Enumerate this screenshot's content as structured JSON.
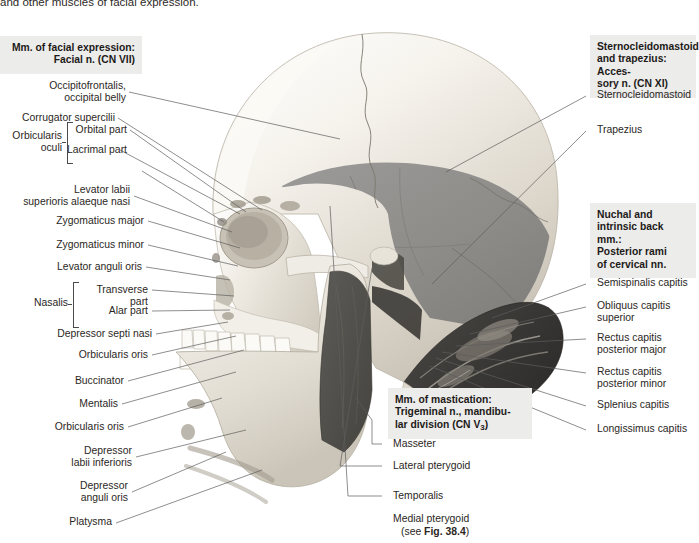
{
  "figure": {
    "top_caption": "and other muscles of facial expression."
  },
  "headers": {
    "facial": "Mm. of facial expression:\nFacial n. (CN VII)",
    "facial_line1": "Mm. of facial expression:",
    "facial_line2": "Facial n. (CN VII)",
    "scm": "Sternocleidomastoid and trapezius: Accessory n. (CN XI)",
    "scm_line1": "Sternocleidomastoid",
    "scm_line2": "and trapezius: Acces-",
    "scm_line3": "sory n. (CN XI)",
    "nuchal_line1": "Nuchal and",
    "nuchal_line2": "intrinsic back mm.:",
    "nuchal_line3": "Posterior rami",
    "nuchal_line4": "of cervical nn.",
    "mastication_line1": "Mm. of mastication:",
    "mastication_line2": "Trigeminal n., mandibu-",
    "mastication_line3a": "lar division (CN V",
    "mastication_line3sub": "3",
    "mastication_line3b": ")"
  },
  "left_labels": [
    {
      "id": "occipitofrontalis",
      "text": "Occipitofrontalis,\noccipital belly"
    },
    {
      "id": "corrugator-supercilii",
      "text": "Corrugator supercilii"
    },
    {
      "id": "orbital-part",
      "text": "Orbital part"
    },
    {
      "id": "lacrimal-part",
      "text": "Lacrimal part"
    },
    {
      "id": "orbicularis-oculi",
      "text": "Orbicularis\noculi"
    },
    {
      "id": "levator-labii-superioris-alaeque-nasi",
      "text": "Levator labii\nsuperioris alaeque nasi"
    },
    {
      "id": "zygomaticus-major",
      "text": "Zygomaticus major"
    },
    {
      "id": "zygomaticus-minor",
      "text": "Zygomaticus minor"
    },
    {
      "id": "levator-anguli-oris",
      "text": "Levator anguli oris"
    },
    {
      "id": "nasalis",
      "text": "Nasalis"
    },
    {
      "id": "transverse-part",
      "text": "Transverse\npart"
    },
    {
      "id": "alar-part",
      "text": "Alar part"
    },
    {
      "id": "depressor-septi-nasi",
      "text": "Depressor septi nasi"
    },
    {
      "id": "orbicularis-oris-upper",
      "text": "Orbicularis oris"
    },
    {
      "id": "buccinator",
      "text": "Buccinator"
    },
    {
      "id": "mentalis",
      "text": "Mentalis"
    },
    {
      "id": "orbicularis-oris-lower",
      "text": "Orbicularis oris"
    },
    {
      "id": "depressor-labii-inferioris",
      "text": "Depressor\nlabii inferioris"
    },
    {
      "id": "depressor-anguli-oris",
      "text": "Depressor\nanguli oris"
    },
    {
      "id": "platysma",
      "text": "Platysma"
    }
  ],
  "right_labels": [
    {
      "id": "sternocleidomastoid",
      "text": "Sternocleidomastoid"
    },
    {
      "id": "trapezius",
      "text": "Trapezius"
    },
    {
      "id": "semispinalis-capitis",
      "text": "Semispinalis capitis"
    },
    {
      "id": "obliquus-capitis-superior",
      "text": "Obliquus capitis\nsuperior"
    },
    {
      "id": "rectus-capitis-posterior-major",
      "text": "Rectus capitis\nposterior major"
    },
    {
      "id": "rectus-capitis-posterior-minor",
      "text": "Rectus capitis\nposterior minor"
    },
    {
      "id": "splenius-capitis",
      "text": "Splenius capitis"
    },
    {
      "id": "longissimus-capitis",
      "text": "Longissimus capitis"
    }
  ],
  "mastication_labels": [
    {
      "id": "masseter",
      "text": "Masseter"
    },
    {
      "id": "lateral-pterygoid",
      "text": "Lateral pterygoid"
    },
    {
      "id": "temporalis",
      "text": "Temporalis"
    },
    {
      "id": "medial-pterygoid",
      "text": "Medial pterygoid"
    },
    {
      "id": "medial-pterygoid-ref_a",
      "text": "(see "
    },
    {
      "id": "medial-pterygoid-ref_b",
      "text": "Fig. 38.4"
    },
    {
      "id": "medial-pterygoid-ref_c",
      "text": ")"
    }
  ],
  "colors": {
    "header_box": "#ececeb",
    "text": "#2b2724",
    "leader": "#5d5d5d",
    "bone_light": "#f2efe9",
    "bone_mid": "#d8d2c8",
    "temporalis_gray": "#8e8d8b",
    "masseter_dark": "#55534f",
    "nuchal_dark": "#3c3a37"
  }
}
